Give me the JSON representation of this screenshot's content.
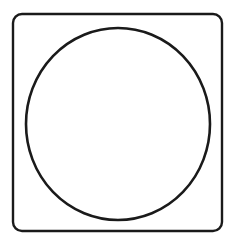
{
  "figure": {
    "background_color": "#ffffff",
    "width": 232,
    "height": 246,
    "stroke_color": "#1a1a1a",
    "fill_color": "#ffffff",
    "shapes": [
      {
        "name": "rounded-square",
        "type": "rounded-rect",
        "x": 13,
        "y": 14,
        "width": 209,
        "height": 217,
        "corner_radius": 9,
        "stroke_width": 2.4,
        "stroke_color": "#1a1a1a",
        "fill": "none"
      },
      {
        "name": "circle",
        "type": "ellipse",
        "center_x": 118,
        "center_y": 124,
        "radius_x": 92,
        "radius_y": 96,
        "stroke_width": 2.6,
        "stroke_color": "#1a1a1a",
        "fill": "none"
      }
    ]
  }
}
